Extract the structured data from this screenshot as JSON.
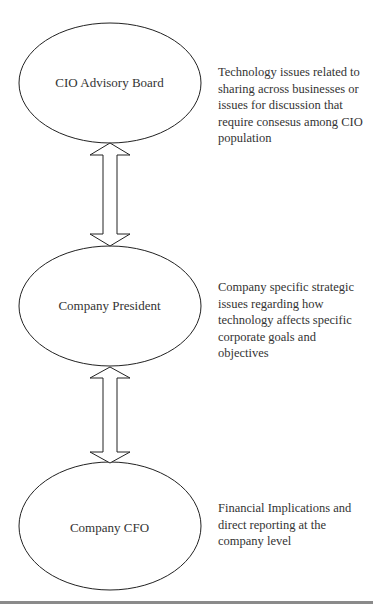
{
  "nodes": [
    {
      "label": "CIO Advisory Board",
      "description": "Technology issues related to sharing across businesses or issues for discussion that require consesus among CIO population"
    },
    {
      "label": "Company President",
      "description": "Company specific strategic issues regarding how technology affects specific corporate goals and objectives"
    },
    {
      "label": "Company CFO",
      "description": "Financial Implications and direct reporting at the company level"
    }
  ],
  "connectors": [
    {
      "from": "CIO Advisory Board",
      "to": "Company President",
      "type": "double-arrow"
    },
    {
      "from": "Company President",
      "to": "Company CFO",
      "type": "double-arrow"
    }
  ],
  "colors": {
    "stroke": "#222222",
    "text": "#333333",
    "background": "#ffffff"
  }
}
